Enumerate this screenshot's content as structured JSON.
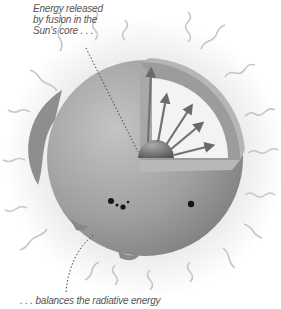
{
  "diagram": {
    "labels": {
      "top": "Energy released by fusion in the Sun's core . . .",
      "bottom": ". . . balances the radiative energy"
    },
    "elements": [
      "sun-sphere",
      "cutaway-wedge",
      "core",
      "energy-arrows",
      "radiation-waves",
      "sunspots",
      "prominence",
      "leader-lines"
    ],
    "colors": {
      "sphere": "#9a9a9a",
      "cut_face": "#b0b0b0",
      "interior": "#f2f2f2",
      "core": "#6e6e6e",
      "waves": "#c8c8c8",
      "arrows": "#707070",
      "sunspots": "#1a1a1a"
    }
  }
}
